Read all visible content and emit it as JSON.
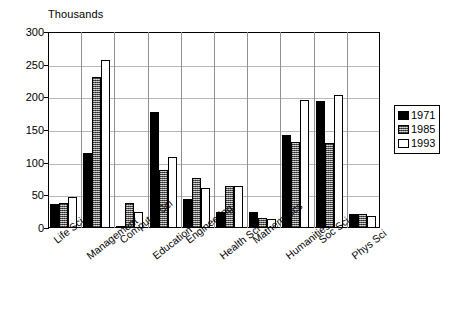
{
  "chart_data": {
    "type": "bar",
    "title": "",
    "subtitle": "",
    "axis_unit_label": "Thousands",
    "xlabel": "",
    "ylabel": "",
    "ylim": [
      0,
      300
    ],
    "yticks": [
      0,
      50,
      100,
      150,
      200,
      250,
      300
    ],
    "ytick_labels": [
      "0",
      "50",
      "100",
      "150",
      "200",
      "250",
      "300"
    ],
    "grid": true,
    "grid_axis": "y",
    "legend_position": "right",
    "categories": [
      "Life Sci",
      "Management",
      "Computer Sci",
      "Education",
      "Engineering",
      "Health Sci",
      "Mathematics",
      "Humanities",
      "Soc Sci",
      "Phys Sci"
    ],
    "series": [
      {
        "name": "1971",
        "color": "#000000",
        "fill": "solid-black",
        "values": [
          37,
          115,
          3,
          177,
          45,
          25,
          25,
          143,
          194,
          22
        ]
      },
      {
        "name": "1985",
        "color": "#8d8d8d",
        "fill": "stippled-gray",
        "values": [
          38,
          231,
          39,
          89,
          77,
          65,
          16,
          131,
          130,
          22
        ]
      },
      {
        "name": "1993",
        "color": "#ffffff",
        "fill": "white-outline",
        "values": [
          47,
          257,
          25,
          108,
          61,
          65,
          14,
          196,
          203,
          18
        ]
      }
    ]
  },
  "legend": {
    "entries": [
      {
        "label": "1971"
      },
      {
        "label": "1985"
      },
      {
        "label": "1993"
      }
    ]
  }
}
